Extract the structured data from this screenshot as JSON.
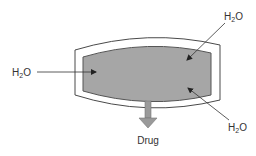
{
  "diagram": {
    "labels": {
      "water_left": {
        "main": "H",
        "sub": "2",
        "end": "O"
      },
      "water_top_right": {
        "main": "H",
        "sub": "2",
        "end": "O"
      },
      "water_bottom_right": {
        "main": "H",
        "sub": "2",
        "end": "O"
      },
      "drug": "Drug"
    },
    "colors": {
      "outline": "#4a4a4a",
      "core_fill": "#a6a6a6",
      "shell_fill": "#ffffff",
      "arrow": "#333333",
      "drug_arrow": "#9a9a9a"
    }
  }
}
